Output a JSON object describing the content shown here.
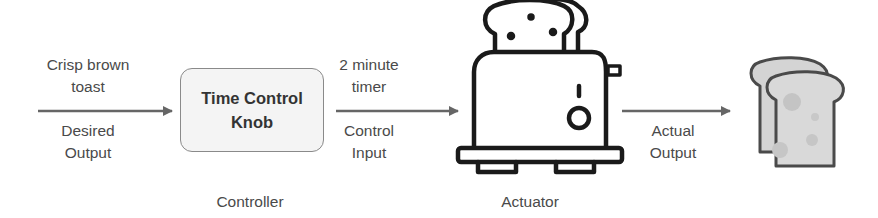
{
  "diagram": {
    "input_arrow": {
      "top_label": "Crisp brown toast",
      "top_lines": [
        "Crisp brown",
        "toast"
      ],
      "bottom_lines": [
        "Desired",
        "Output"
      ]
    },
    "controller": {
      "box_lines": [
        "Time Control",
        "Knob"
      ],
      "caption": "Controller"
    },
    "middle_arrow": {
      "top_lines": [
        "2 minute",
        "timer"
      ],
      "bottom_lines": [
        "Control",
        "Input"
      ]
    },
    "actuator": {
      "icon": "toaster-icon",
      "caption": "Actuator"
    },
    "output_arrow": {
      "bottom_lines": [
        "Actual",
        "Output"
      ]
    },
    "result": {
      "icon": "toast-slices-icon"
    },
    "colors": {
      "arrow": "#666666",
      "text": "#4a4a4a",
      "box_fill": "#f4f4f4",
      "box_border": "#8a8a8a",
      "icon_stroke": "#1a1a1a",
      "toast_fill": "#d9d9d9"
    }
  }
}
